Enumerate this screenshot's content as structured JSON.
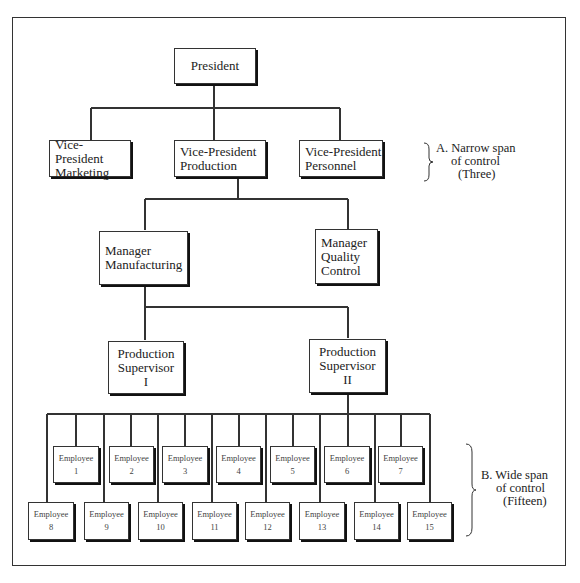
{
  "diagram": {
    "type": "organization-chart",
    "nodes": {
      "president": {
        "line1": "President"
      },
      "vp_marketing": {
        "line1": "Vice-President",
        "line2": "Marketing"
      },
      "vp_production": {
        "line1": "Vice-President",
        "line2": "Production"
      },
      "vp_personnel": {
        "line1": "Vice-President",
        "line2": "Personnel"
      },
      "mgr_manufacturing": {
        "line1": "Manager",
        "line2": "Manufacturing"
      },
      "mgr_quality": {
        "line1": "Manager",
        "line2": "Quality",
        "line3": "Control"
      },
      "sup1": {
        "line1": "Production",
        "line2": "Supervisor",
        "line3": "I"
      },
      "sup2": {
        "line1": "Production",
        "line2": "Supervisor",
        "line3": "II"
      }
    },
    "employees": [
      {
        "label": "Employee",
        "num": "1"
      },
      {
        "label": "Employee",
        "num": "2"
      },
      {
        "label": "Employee",
        "num": "3"
      },
      {
        "label": "Employee",
        "num": "4"
      },
      {
        "label": "Employee",
        "num": "5"
      },
      {
        "label": "Employee",
        "num": "6"
      },
      {
        "label": "Employee",
        "num": "7"
      },
      {
        "label": "Employee",
        "num": "8"
      },
      {
        "label": "Employee",
        "num": "9"
      },
      {
        "label": "Employee",
        "num": "10"
      },
      {
        "label": "Employee",
        "num": "11"
      },
      {
        "label": "Employee",
        "num": "12"
      },
      {
        "label": "Employee",
        "num": "13"
      },
      {
        "label": "Employee",
        "num": "14"
      },
      {
        "label": "Employee",
        "num": "15"
      }
    ],
    "annotations": {
      "narrow": {
        "line1": "A. Narrow span",
        "line2": "of control",
        "line3": "(Three)"
      },
      "wide": {
        "line1": "B. Wide span",
        "line2": "of control",
        "line3": "(Fifteen)"
      }
    },
    "edges": [
      [
        "President",
        "Vice-President Marketing"
      ],
      [
        "President",
        "Vice-President Production"
      ],
      [
        "President",
        "Vice-President Personnel"
      ],
      [
        "Vice-President Production",
        "Manager Manufacturing"
      ],
      [
        "Vice-President Production",
        "Manager Quality Control"
      ],
      [
        "Manager Manufacturing",
        "Production Supervisor I"
      ],
      [
        "Manager Manufacturing",
        "Production Supervisor II"
      ],
      [
        "Production Supervisor II",
        "Employee 1-15"
      ]
    ]
  }
}
